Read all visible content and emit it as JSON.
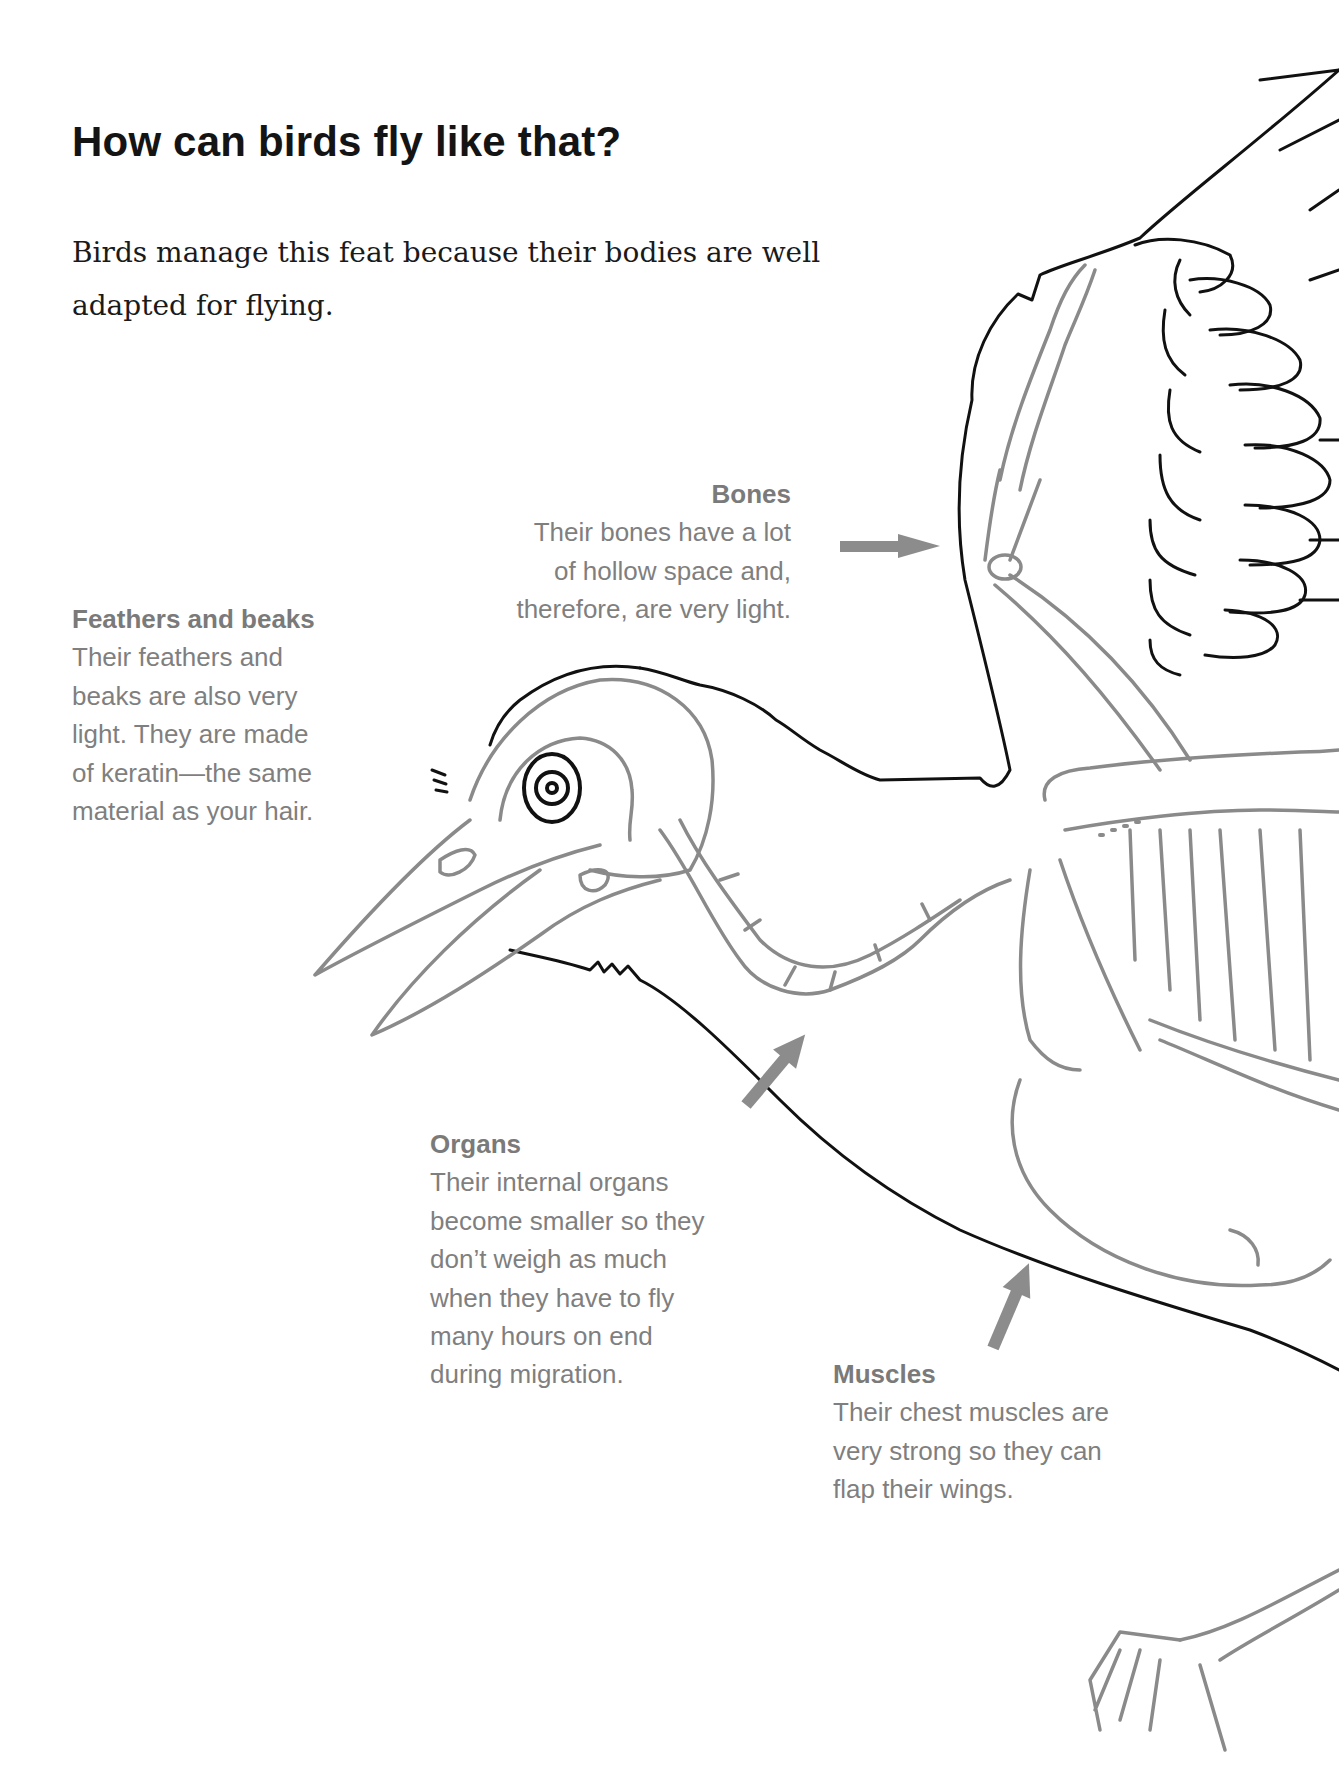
{
  "page": {
    "title": "How can birds fly like that?",
    "intro": "Birds manage this feat because their bodies are well adapted for flying.",
    "intro_lines": [
      "Birds manage this feat because their bodies are well",
      "adapted for flying."
    ]
  },
  "callouts": {
    "bones": {
      "heading": "Bones",
      "lines": [
        "Their bones have a lot",
        "of hollow space and,",
        "therefore, are very light."
      ]
    },
    "feathers": {
      "heading": "Feathers and beaks",
      "lines": [
        "Their feathers and",
        "beaks are also very",
        "light. They are made",
        "of keratin—the same",
        "material as your hair."
      ]
    },
    "organs": {
      "heading": "Organs",
      "lines": [
        "Their internal organs",
        "become smaller so they",
        "don’t weigh as much",
        "when they have to fly",
        "many hours on end",
        "during migration."
      ]
    },
    "muscles": {
      "heading": "Muscles",
      "lines": [
        "Their chest muscles are",
        "very strong so they can",
        "flap their wings."
      ]
    }
  },
  "illustration": {
    "subject": "bird-anatomy-skeleton-diagram",
    "outline_color": "#111111",
    "skeleton_color": "#8a8a8a",
    "arrow_color": "#8c8c8c",
    "label_color": "#7f7f7f"
  }
}
